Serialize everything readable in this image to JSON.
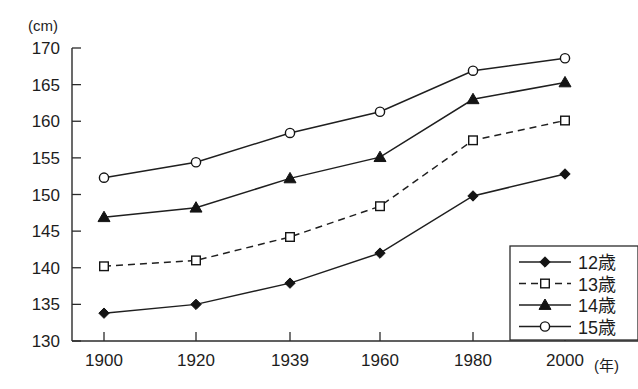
{
  "chart_data": {
    "type": "line",
    "title": "",
    "subtitle": "",
    "xlabel": "(年)",
    "ylabel": "(cm)",
    "x": [
      1900,
      1920,
      1939,
      1960,
      1980,
      2000
    ],
    "xtick_labels": [
      "1900",
      "1920",
      "1939",
      "1960",
      "1980",
      "2000"
    ],
    "ytick_labels": [
      "170",
      "165",
      "160",
      "155",
      "150",
      "145",
      "140",
      "135",
      "130"
    ],
    "ylim": [
      130,
      170
    ],
    "ytick_step": 5,
    "grid": false,
    "legend_position": "bottom-right",
    "series": [
      {
        "name": "12歳",
        "marker": "filled-diamond",
        "linestyle": "solid",
        "color": "#141414",
        "values": [
          133.8,
          135.0,
          137.9,
          142.0,
          149.8,
          152.8
        ]
      },
      {
        "name": "13歳",
        "marker": "open-square",
        "linestyle": "dashed",
        "color": "#141414",
        "values": [
          140.2,
          141.0,
          144.2,
          148.4,
          157.4,
          160.1
        ]
      },
      {
        "name": "14歳",
        "marker": "filled-triangle",
        "linestyle": "solid",
        "color": "#141414",
        "values": [
          146.9,
          148.2,
          152.2,
          155.1,
          163.0,
          165.3
        ]
      },
      {
        "name": "15歳",
        "marker": "open-circle",
        "linestyle": "solid",
        "color": "#141414",
        "values": [
          152.3,
          154.4,
          158.4,
          161.3,
          166.9,
          168.6
        ]
      }
    ]
  },
  "axes": {
    "y_unit_label": "(cm)",
    "x_unit_label": "(年)"
  },
  "legend": {
    "entries": [
      {
        "label": "12歳"
      },
      {
        "label": "13歳"
      },
      {
        "label": "14歳"
      },
      {
        "label": "15歳"
      }
    ]
  }
}
